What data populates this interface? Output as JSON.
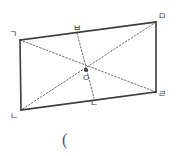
{
  "figure": {
    "stroke_color": "#3d3d3d",
    "dotted_color": "#6b6b6b",
    "label_color": "#3a3a3a",
    "background": "#ffffff",
    "outline": {
      "name": "quadrilateral-outline",
      "points": "20,40 156,22 156,92 21,110"
    },
    "vertices": [
      {
        "id": "g",
        "label": "ㄱ",
        "x": 20,
        "y": 40,
        "label_x": 9,
        "label_y": 30
      },
      {
        "id": "m",
        "label": "ㅁ",
        "x": 156,
        "y": 22,
        "label_x": 158,
        "label_y": 12
      },
      {
        "id": "r",
        "label": "ㄹ",
        "x": 156,
        "y": 92,
        "label_x": 158,
        "label_y": 90
      },
      {
        "id": "n",
        "label": "ㄴ",
        "x": 21,
        "y": 110,
        "label_x": 10,
        "label_y": 112
      }
    ],
    "midpoints": [
      {
        "id": "b",
        "label": "ㅂ",
        "x": 77,
        "y": 33,
        "label_x": 73,
        "label_y": 24
      },
      {
        "id": "d",
        "label": "ㄷ",
        "x": 94,
        "y": 98,
        "label_x": 90,
        "label_y": 99
      }
    ],
    "center": {
      "id": "o",
      "label": "O",
      "x": 86,
      "y": 70,
      "label_x": 83,
      "label_y": 74,
      "marker_radius": 2.1
    },
    "solid_edges": [
      {
        "name": "edge-g-m",
        "x1": 20,
        "y1": 40,
        "x2": 156,
        "y2": 22
      },
      {
        "name": "edge-m-r",
        "x1": 156,
        "y1": 22,
        "x2": 156,
        "y2": 92
      },
      {
        "name": "edge-r-n",
        "x1": 156,
        "y1": 92,
        "x2": 21,
        "y2": 110
      },
      {
        "name": "edge-n-g",
        "x1": 21,
        "y1": 110,
        "x2": 20,
        "y2": 40
      }
    ],
    "dotted_lines": [
      {
        "name": "diagonal-g-r",
        "x1": 20,
        "y1": 40,
        "x2": 156,
        "y2": 92
      },
      {
        "name": "diagonal-m-n",
        "x1": 156,
        "y1": 22,
        "x2": 21,
        "y2": 110
      },
      {
        "name": "segment-b-d",
        "x1": 77,
        "y1": 33,
        "x2": 94,
        "y2": 98
      }
    ]
  },
  "caption": {
    "name": "caption-paren",
    "text": "(",
    "x": 62,
    "y": 132
  }
}
